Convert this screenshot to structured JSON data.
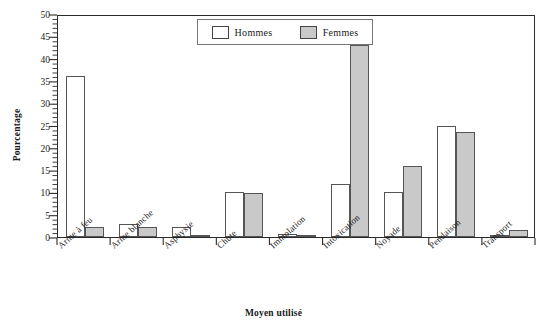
{
  "chart_data": {
    "type": "bar",
    "title": "",
    "xlabel": "Moyen utilisé",
    "ylabel": "Pourcentage",
    "ylim": [
      0,
      50
    ],
    "ytick_step": 5,
    "yticks": [
      0,
      5,
      10,
      15,
      20,
      25,
      30,
      35,
      40,
      45,
      50
    ],
    "grid": false,
    "legend_position": "top-center",
    "categories": [
      "Arme à feu",
      "Arme blanche",
      "Asphyxie",
      "Chute",
      "Immolation",
      "Intoxication",
      "Noyade",
      "Pendaison",
      "Transport"
    ],
    "series": [
      {
        "name": "Hommes",
        "color": "#ffffff",
        "values": [
          36.0,
          2.9,
          2.2,
          10.0,
          0.6,
          11.8,
          10.0,
          25.0,
          0.4
        ]
      },
      {
        "name": "Femmes",
        "color": "#c9c9c9",
        "values": [
          2.3,
          2.2,
          0.4,
          9.8,
          0.4,
          43.0,
          16.0,
          23.5,
          1.6
        ]
      }
    ]
  },
  "legend": {
    "entries": [
      {
        "label": "Hommes",
        "swatch": "hommes"
      },
      {
        "label": "Femmes",
        "swatch": "femmes"
      }
    ]
  },
  "axes": {
    "y_title": "Pourcentage",
    "x_title": "Moyen utilisé"
  },
  "colors": {
    "hommes_fill": "#ffffff",
    "femmes_fill": "#c9c9c9",
    "axis": "#2b2b2b",
    "bar_stroke": "#555555"
  }
}
